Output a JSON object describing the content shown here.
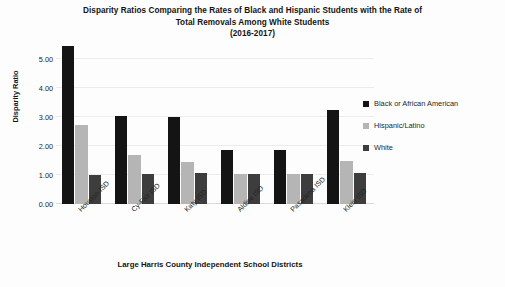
{
  "chart_data": {
    "type": "bar",
    "title": "Disparity Ratios Comparing the Rates of Black and Hispanic Students with the Rate of Total Removals Among White Students (2016-2017)",
    "title_lines": [
      "Disparity Ratios Comparing the Rates of Black and Hispanic Students with the Rate of",
      "Total Removals Among White Students",
      "(2016-2017)"
    ],
    "xlabel": "Large Harris County Independent School Districts",
    "ylabel": "Disparity Ratio",
    "categories": [
      "Houston ISD",
      "Cy-Fair ISD",
      "Katy ISD",
      "Aldine ISD",
      "Pasadena ISD",
      "Klein ISD"
    ],
    "series": [
      {
        "name": "Black or African American",
        "color": "#141414",
        "values": [
          5.45,
          3.05,
          3.02,
          1.88,
          1.88,
          3.25
        ]
      },
      {
        "name": "Hispanic/Latino",
        "color": "#b5b5b5",
        "values": [
          2.73,
          1.68,
          1.45,
          1.05,
          1.05,
          1.48
        ]
      },
      {
        "name": "White",
        "color": "#3d3d3d",
        "values": [
          1.0,
          1.05,
          1.08,
          1.03,
          1.05,
          1.08
        ]
      }
    ],
    "ylim": [
      0,
      5.6
    ],
    "yticks": [
      0,
      1,
      2,
      3,
      4,
      5
    ],
    "ytick_labels": [
      "0.00",
      "1.00",
      "2.00",
      "3.00",
      "4.00",
      "5.00"
    ],
    "grid": true,
    "legend_position": "right"
  }
}
